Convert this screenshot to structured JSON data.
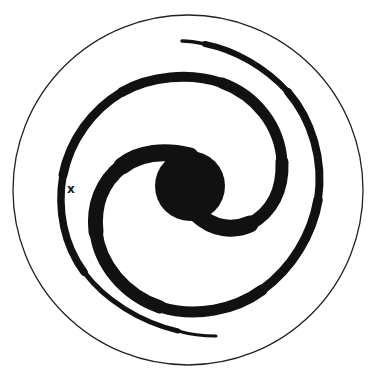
{
  "diagram": {
    "type": "spiral-galaxy",
    "colors": {
      "ink": "#111111",
      "background": "#ffffff"
    },
    "boundary": {
      "cx": 188,
      "cy": 190,
      "r": 175
    },
    "bulge": {
      "cx": 190,
      "cy": 186,
      "r": 35
    },
    "arms": [
      {
        "name": "arm-1"
      },
      {
        "name": "arm-2"
      }
    ],
    "marker": {
      "label": "x",
      "x": 67,
      "y": 183
    }
  }
}
